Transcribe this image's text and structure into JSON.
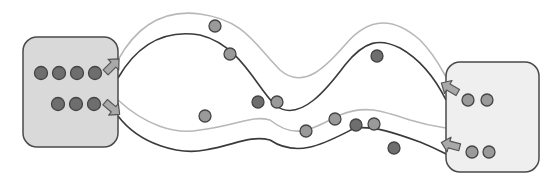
{
  "diagram": {
    "width": 560,
    "height": 179,
    "colors": {
      "background": "#ffffff",
      "left_box_fill": "#d9d9d9",
      "right_box_fill": "#efefef",
      "box_stroke": "#4a4a4a",
      "dark_line": "#3a3a3a",
      "light_line": "#b8b8b8",
      "arrow_fill": "#a9a9a9",
      "arrow_stroke": "#555555",
      "particle_dark": "#6e6e6e",
      "particle_light": "#9a9a9a",
      "particle_stroke": "#444444"
    },
    "left_box": {
      "x": 23,
      "y": 37,
      "w": 95,
      "h": 110,
      "r": 14,
      "label": ""
    },
    "right_box": {
      "x": 446,
      "y": 62,
      "w": 93,
      "h": 110,
      "r": 14,
      "label": ""
    },
    "left_box_particles": [
      {
        "cx": 41,
        "cy": 73,
        "r": 6.5,
        "shade": "dark"
      },
      {
        "cx": 59,
        "cy": 73,
        "r": 6.5,
        "shade": "dark"
      },
      {
        "cx": 77,
        "cy": 73,
        "r": 6.5,
        "shade": "dark"
      },
      {
        "cx": 95,
        "cy": 73,
        "r": 6.5,
        "shade": "dark"
      },
      {
        "cx": 58,
        "cy": 104,
        "r": 6.5,
        "shade": "dark"
      },
      {
        "cx": 76,
        "cy": 104,
        "r": 6.5,
        "shade": "dark"
      },
      {
        "cx": 94,
        "cy": 104,
        "r": 6.5,
        "shade": "dark"
      }
    ],
    "right_box_particles": [
      {
        "cx": 468,
        "cy": 100,
        "r": 6,
        "shade": "light"
      },
      {
        "cx": 487,
        "cy": 100,
        "r": 6,
        "shade": "light"
      },
      {
        "cx": 472,
        "cy": 152,
        "r": 6,
        "shade": "light"
      },
      {
        "cx": 489,
        "cy": 152,
        "r": 6,
        "shade": "light"
      }
    ],
    "free_particles": [
      {
        "cx": 215,
        "cy": 26,
        "r": 6,
        "shade": "light"
      },
      {
        "cx": 230,
        "cy": 54,
        "r": 6,
        "shade": "light"
      },
      {
        "cx": 377,
        "cy": 56,
        "r": 6,
        "shade": "dark"
      },
      {
        "cx": 258,
        "cy": 102,
        "r": 6,
        "shade": "dark"
      },
      {
        "cx": 277,
        "cy": 102,
        "r": 6,
        "shade": "light"
      },
      {
        "cx": 205,
        "cy": 116,
        "r": 6,
        "shade": "light"
      },
      {
        "cx": 335,
        "cy": 119,
        "r": 6,
        "shade": "light"
      },
      {
        "cx": 306,
        "cy": 131,
        "r": 6,
        "shade": "light"
      },
      {
        "cx": 356,
        "cy": 125,
        "r": 6,
        "shade": "dark"
      },
      {
        "cx": 374,
        "cy": 124,
        "r": 6,
        "shade": "light"
      },
      {
        "cx": 394,
        "cy": 148,
        "r": 6,
        "shade": "dark"
      }
    ],
    "channels": [
      {
        "name": "upper-channel",
        "light_path": "M118,60 C140,20 170,10 200,14 C245,20 255,45 280,70 C305,92 330,62 345,45 C370,15 395,18 420,40 C435,55 442,70 446,77",
        "dark_path": "M118,78 C140,40 170,30 200,35 C240,45 255,85 275,105 C300,125 330,85 345,65 C365,40 380,38 400,48 C425,62 440,88 446,100"
      },
      {
        "name": "lower-channel",
        "light_path": "M118,100 C145,125 175,135 200,130 C240,125 250,115 270,120 C295,140 310,130 340,115 C365,105 380,110 410,120 C430,126 440,127 446,128",
        "dark_path": "M118,116 C140,145 180,155 205,150 C235,145 250,135 270,140 C300,160 330,140 355,128 C375,126 395,133 420,142 C435,148 442,152 446,154"
      }
    ],
    "arrows": [
      {
        "name": "left-upper-out-arrow",
        "x": 112,
        "y": 66,
        "angle": -45
      },
      {
        "name": "left-lower-out-arrow",
        "x": 112,
        "y": 108,
        "angle": 40
      },
      {
        "name": "right-upper-in-arrow",
        "x": 450,
        "y": 88,
        "angle": -150
      },
      {
        "name": "right-lower-in-arrow",
        "x": 451,
        "y": 145,
        "angle": -165
      }
    ]
  }
}
